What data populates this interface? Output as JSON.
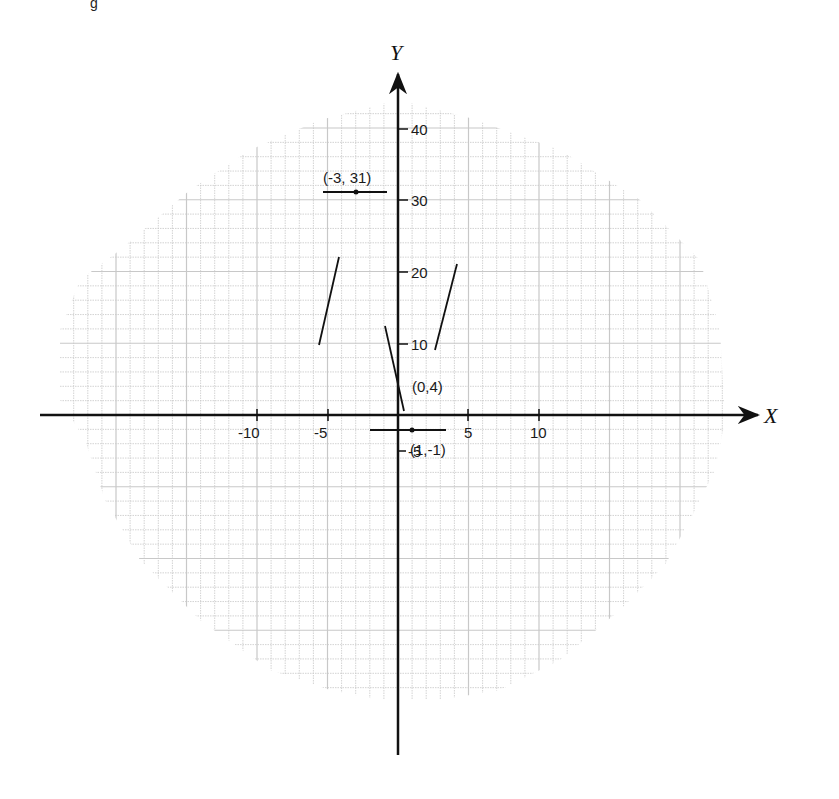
{
  "figure": {
    "caption_fragment": "g",
    "background": "#ffffff",
    "grid_color": "#c8c8c8",
    "ink_color": "#111111"
  },
  "axes": {
    "x_label": "X",
    "y_label": "Y",
    "x_ticks": [
      {
        "value": -10,
        "label": "-10"
      },
      {
        "value": -5,
        "label": "-5"
      },
      {
        "value": 5,
        "label": "5"
      },
      {
        "value": 10,
        "label": "10"
      }
    ],
    "y_ticks": [
      {
        "value": 40,
        "label": "40"
      },
      {
        "value": 30,
        "label": "30"
      },
      {
        "value": 20,
        "label": "20"
      },
      {
        "value": 10,
        "label": "10"
      },
      {
        "value": -5,
        "label": "-5"
      }
    ]
  },
  "points": [
    {
      "label": "(-3, 31)",
      "x": -3,
      "y": 31
    },
    {
      "label": "(0,4)",
      "x": 0,
      "y": 4
    },
    {
      "label": "(1,-1)",
      "x": 1,
      "y": -1
    }
  ],
  "chart_data": {
    "type": "line",
    "title": "",
    "xlabel": "X",
    "ylabel": "Y",
    "xlim": [
      -13,
      12
    ],
    "ylim": [
      -12,
      44
    ],
    "grid": true,
    "x_ticks": [
      -10,
      -5,
      5,
      10
    ],
    "y_ticks": [
      -5,
      10,
      20,
      30,
      40
    ],
    "annotations": [
      "(-3, 31)",
      "(0,4)",
      "(1,-1)"
    ],
    "series": [
      {
        "name": "tangent at (-3,31)",
        "kind": "segment",
        "x": [
          -5.5,
          -0.5
        ],
        "y": [
          31,
          31
        ],
        "slope": 0
      },
      {
        "name": "tangent at (0,4)",
        "kind": "segment",
        "x": [
          -1.4,
          0.7
        ],
        "y": [
          12.5,
          0.7
        ],
        "slope": -6
      },
      {
        "name": "tangent at (1,-1)",
        "kind": "segment",
        "x": [
          -1,
          3
        ],
        "y": [
          -1,
          -1
        ],
        "slope": 0
      },
      {
        "name": "segment left",
        "kind": "segment",
        "x": [
          -5.4,
          -3.9
        ],
        "y": [
          9.5,
          22.5
        ]
      },
      {
        "name": "segment right",
        "kind": "segment",
        "x": [
          2.4,
          4.4
        ],
        "y": [
          8.8,
          21.5
        ]
      }
    ]
  }
}
